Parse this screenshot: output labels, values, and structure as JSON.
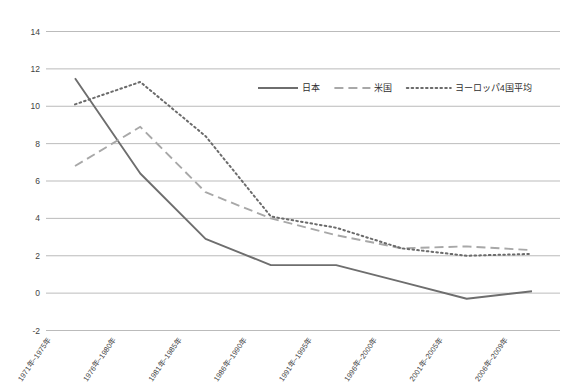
{
  "chart_data": {
    "type": "line",
    "title": "",
    "subtitle": "",
    "xlabel": "",
    "ylabel": "",
    "grid": "horizontal",
    "legend_position": "top-right",
    "ylim": [
      -2,
      14
    ],
    "ytick_step": 2,
    "yticks": [
      "14",
      "12",
      "10",
      "8",
      "6",
      "4",
      "2",
      "0",
      "-2"
    ],
    "ytick_values": [
      14,
      12,
      10,
      8,
      6,
      4,
      2,
      0,
      -2
    ],
    "categories": [
      "1971年~1975年",
      "1976年~1980年",
      "1981年~1985年",
      "1986年~1990年",
      "1991年~1995年",
      "1996年~2000年",
      "2001年~2005年",
      "2006年~2009年"
    ],
    "series": [
      {
        "name": "日本",
        "style": "solid",
        "color": "#6e6e6e",
        "values": [
          11.5,
          6.4,
          2.9,
          1.5,
          1.5,
          0.6,
          -0.3,
          0.1
        ]
      },
      {
        "name": "米国",
        "style": "dashed",
        "color": "#a8a8a8",
        "values": [
          6.8,
          8.9,
          5.4,
          4.0,
          3.1,
          2.4,
          2.5,
          2.3
        ]
      },
      {
        "name": "ヨーロッパ4国平均",
        "style": "dotted",
        "color": "#6b6b6b",
        "values": [
          10.1,
          11.3,
          8.4,
          4.1,
          3.5,
          2.4,
          2.0,
          2.1
        ]
      }
    ]
  },
  "legend": {
    "items": [
      {
        "label": "日本"
      },
      {
        "label": "米国"
      },
      {
        "label": "ヨーロッパ4国平均"
      }
    ]
  }
}
